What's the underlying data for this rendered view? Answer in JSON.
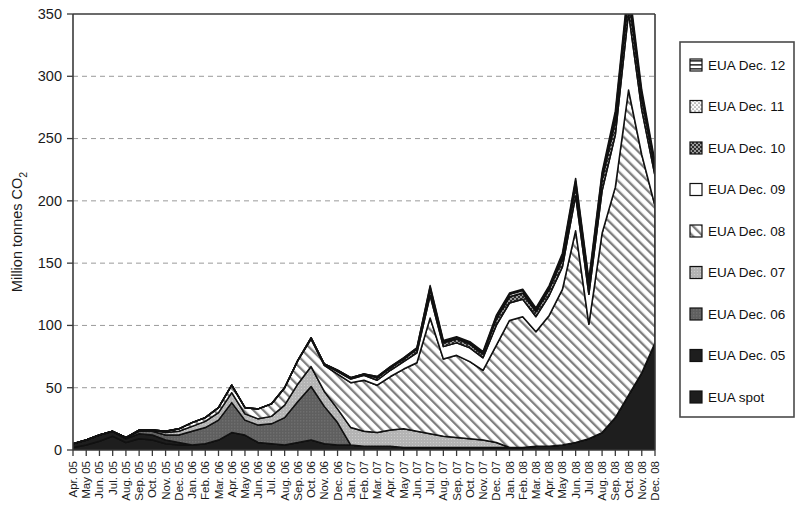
{
  "chart_data": {
    "type": "area",
    "stacked": true,
    "title": "",
    "subtitle": "",
    "xlabel": "",
    "ylabel": "Million tonnes CO2",
    "ylabel_display": "Million tonnes CO",
    "ylabel_sub": "2",
    "ylim": [
      0,
      350
    ],
    "yticks": [
      0,
      50,
      100,
      150,
      200,
      250,
      300,
      350
    ],
    "grid": "horizontal-dashed",
    "legend_position": "right-outside",
    "x": [
      "Apr. 05",
      "May 05",
      "Jun. 05",
      "Jul. 05",
      "Aug. 05",
      "Sep. 05",
      "Oct. 05",
      "Nov. 05",
      "Dec. 05",
      "Jan. 06",
      "Feb. 06",
      "Mar. 06",
      "Apr. 06",
      "May 06",
      "Jun. 06",
      "Jul. 06",
      "Aug. 06",
      "Sep. 06",
      "Oct. 06",
      "Nov. 06",
      "Dec. 06",
      "Jan. 07",
      "Feb. 07",
      "Mar. 07",
      "Apr. 07",
      "May 07",
      "Jun. 07",
      "Jul. 07",
      "Aug. 07",
      "Sep. 07",
      "Oct. 07",
      "Nov. 07",
      "Dec. 07",
      "Jan. 08",
      "Feb. 08",
      "Mar. 08",
      "Apr. 08",
      "May 08",
      "Jun. 08",
      "Jul. 08",
      "Aug. 08",
      "Sep. 08",
      "Oct. 08",
      "Nov. 08",
      "Dec. 08"
    ],
    "series": [
      {
        "name": "EUA spot",
        "pattern": "solid-black",
        "color": "#1c1c1c",
        "values": [
          2,
          4,
          7,
          11,
          6,
          9,
          8,
          5,
          4,
          4,
          5,
          8,
          14,
          12,
          6,
          5,
          4,
          6,
          8,
          5,
          4,
          4,
          3,
          3,
          3,
          2,
          2,
          2,
          2,
          2,
          2,
          2,
          2,
          2,
          2,
          3,
          3,
          4,
          6,
          9,
          14,
          26,
          44,
          62,
          86
        ]
      },
      {
        "name": "EUA Dec. 05",
        "pattern": "solid-black",
        "color": "#272727",
        "values": [
          3,
          4,
          5,
          4,
          3,
          4,
          4,
          3,
          2,
          0,
          0,
          0,
          0,
          0,
          0,
          0,
          0,
          0,
          0,
          0,
          0,
          0,
          0,
          0,
          0,
          0,
          0,
          0,
          0,
          0,
          0,
          0,
          0,
          0,
          0,
          0,
          0,
          0,
          0,
          0,
          0,
          0,
          0,
          0,
          0
        ]
      },
      {
        "name": "EUA Dec. 06",
        "pattern": "dark-gray",
        "color": "#5d5d5d",
        "values": [
          0,
          0,
          0,
          0,
          1,
          2,
          3,
          4,
          6,
          11,
          13,
          16,
          24,
          12,
          14,
          16,
          22,
          33,
          43,
          30,
          18,
          0,
          0,
          0,
          0,
          0,
          0,
          0,
          0,
          0,
          0,
          0,
          0,
          0,
          0,
          0,
          0,
          0,
          0,
          0,
          0,
          0,
          0,
          0,
          0
        ]
      },
      {
        "name": "EUA Dec. 07",
        "pattern": "light-gray",
        "color": "#b0b0b0",
        "values": [
          0,
          0,
          0,
          0,
          0,
          1,
          1,
          2,
          3,
          4,
          5,
          6,
          8,
          5,
          5,
          6,
          10,
          14,
          16,
          12,
          11,
          14,
          12,
          11,
          13,
          15,
          13,
          11,
          9,
          8,
          7,
          6,
          4,
          0,
          0,
          0,
          0,
          0,
          0,
          0,
          0,
          0,
          0,
          0,
          0
        ]
      },
      {
        "name": "EUA Dec. 08",
        "pattern": "diagonal-hatch",
        "color": "#eeeeee",
        "values": [
          0,
          0,
          0,
          0,
          0,
          0,
          0,
          1,
          2,
          3,
          3,
          4,
          6,
          5,
          8,
          10,
          14,
          19,
          22,
          21,
          28,
          36,
          41,
          38,
          43,
          48,
          55,
          93,
          62,
          66,
          62,
          56,
          78,
          102,
          105,
          92,
          105,
          125,
          170,
          92,
          160,
          185,
          245,
          175,
          110
        ]
      },
      {
        "name": "EUA Dec. 09",
        "pattern": "white",
        "color": "#ffffff",
        "values": [
          0,
          0,
          0,
          0,
          0,
          0,
          0,
          0,
          0,
          0,
          0,
          0,
          0,
          0,
          0,
          0,
          0,
          0,
          1,
          1,
          2,
          3,
          4,
          4,
          5,
          6,
          8,
          18,
          10,
          10,
          11,
          10,
          16,
          14,
          14,
          12,
          16,
          18,
          28,
          24,
          34,
          42,
          62,
          36,
          24
        ]
      },
      {
        "name": "EUA Dec. 10",
        "pattern": "dark-dots",
        "color": "#3c3c3c",
        "values": [
          0,
          0,
          0,
          0,
          0,
          0,
          0,
          0,
          0,
          0,
          0,
          0,
          0,
          0,
          0,
          0,
          0,
          0,
          0,
          0,
          1,
          1,
          1,
          2,
          2,
          2,
          3,
          5,
          3,
          3,
          3,
          3,
          5,
          5,
          5,
          4,
          5,
          6,
          8,
          7,
          9,
          11,
          14,
          9,
          6
        ]
      },
      {
        "name": "EUA Dec. 11",
        "pattern": "light-dots",
        "color": "#e2e2e2",
        "values": [
          0,
          0,
          0,
          0,
          0,
          0,
          0,
          0,
          0,
          0,
          0,
          0,
          0,
          0,
          0,
          0,
          0,
          0,
          0,
          0,
          0,
          0,
          0,
          1,
          1,
          1,
          1,
          2,
          1,
          1,
          1,
          1,
          2,
          2,
          2,
          2,
          2,
          3,
          4,
          3,
          4,
          5,
          6,
          4,
          3
        ]
      },
      {
        "name": "EUA Dec. 12",
        "pattern": "horizontal-lines",
        "color": "#f2f2f2",
        "values": [
          0,
          0,
          0,
          0,
          0,
          0,
          0,
          0,
          0,
          0,
          0,
          0,
          0,
          0,
          0,
          0,
          0,
          0,
          0,
          0,
          0,
          0,
          0,
          0,
          0,
          0,
          0,
          1,
          1,
          1,
          1,
          1,
          1,
          1,
          1,
          1,
          1,
          2,
          2,
          2,
          2,
          3,
          4,
          3,
          2
        ]
      }
    ],
    "legend_entries": [
      {
        "label": "EUA Dec. 12",
        "pattern": "horizontal-lines"
      },
      {
        "label": "EUA Dec. 11",
        "pattern": "light-dots"
      },
      {
        "label": "EUA Dec. 10",
        "pattern": "dark-dots"
      },
      {
        "label": "EUA Dec. 09",
        "pattern": "white"
      },
      {
        "label": "EUA Dec. 08",
        "pattern": "diagonal-hatch"
      },
      {
        "label": "EUA Dec. 07",
        "pattern": "light-gray"
      },
      {
        "label": "EUA Dec. 06",
        "pattern": "dark-gray"
      },
      {
        "label": "EUA Dec. 05",
        "pattern": "solid-black"
      },
      {
        "label": "EUA spot",
        "pattern": "solid-black"
      }
    ]
  }
}
